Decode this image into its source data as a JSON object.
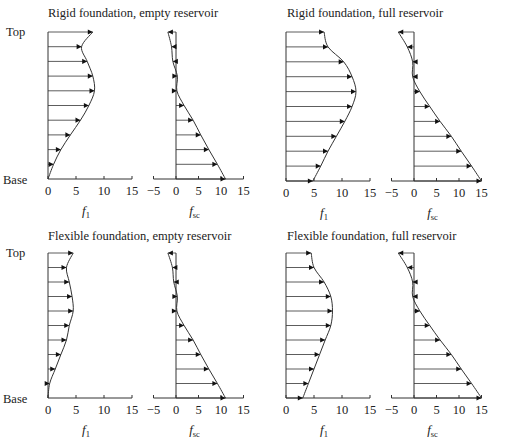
{
  "figure": {
    "labels": {
      "top": "Top",
      "base": "Base"
    }
  },
  "chart_data": [
    {
      "type": "line",
      "title": "Rigid foundation, empty reservoir",
      "subplots": [
        {
          "xlabel": "f1",
          "xlabel_main": "f",
          "xlabel_sub": "1",
          "xticks": [
            0,
            5,
            10,
            15
          ],
          "xlim": [
            0,
            15
          ],
          "heights": [
            "Top",
            "",
            "",
            "",
            "",
            "",
            "",
            "",
            "",
            "",
            "Base"
          ],
          "values": [
            8.0,
            6.0,
            7.0,
            8.0,
            8.3,
            7.3,
            5.8,
            4.0,
            2.3,
            1.0,
            0.0
          ]
        },
        {
          "xlabel": "fsc",
          "xlabel_main": "f",
          "xlabel_sub": "sc",
          "xticks": [
            -5,
            0,
            5,
            10,
            15
          ],
          "xlim": [
            -5,
            15
          ],
          "values": [
            -1.8,
            -1.0,
            -0.7,
            0.3,
            0.2,
            1.8,
            3.8,
            5.5,
            7.3,
            9.2,
            11.0
          ]
        }
      ]
    },
    {
      "type": "line",
      "title": "Rigid foundation, full reservoir",
      "subplots": [
        {
          "xlabel": "f1",
          "xlabel_main": "f",
          "xlabel_sub": "1",
          "xticks": [
            0,
            5,
            10,
            15
          ],
          "xlim": [
            0,
            15
          ],
          "values": [
            6.8,
            7.5,
            10.3,
            11.8,
            12.5,
            11.8,
            10.5,
            9.0,
            7.5,
            6.2,
            4.8
          ]
        },
        {
          "xlabel": "fsc",
          "xlabel_main": "f",
          "xlabel_sub": "sc",
          "xticks": [
            -5,
            0,
            5,
            10,
            15
          ],
          "xlim": [
            -5,
            15
          ],
          "values": [
            -3.5,
            -1.5,
            -0.3,
            -0.3,
            1.3,
            3.5,
            5.8,
            8.3,
            10.5,
            12.8,
            15.0
          ]
        }
      ]
    },
    {
      "type": "line",
      "title": "Flexible foundation, empty reservoir",
      "subplots": [
        {
          "xlabel": "f1",
          "xlabel_main": "f",
          "xlabel_sub": "1",
          "xticks": [
            0,
            5,
            10,
            15
          ],
          "xlim": [
            0,
            15
          ],
          "values": [
            4.5,
            3.3,
            3.8,
            4.3,
            4.5,
            3.8,
            3.3,
            2.3,
            1.3,
            0.3,
            0.0
          ]
        },
        {
          "xlabel": "fsc",
          "xlabel_main": "f",
          "xlabel_sub": "sc",
          "xticks": [
            -5,
            0,
            5,
            10,
            15
          ],
          "xlim": [
            -5,
            15
          ],
          "values": [
            -1.8,
            -0.8,
            -0.5,
            0.3,
            0.2,
            1.8,
            3.8,
            5.5,
            7.3,
            9.2,
            11.0
          ]
        }
      ]
    },
    {
      "type": "line",
      "title": "Flexible foundation, full reservoir",
      "subplots": [
        {
          "xlabel": "f1",
          "xlabel_main": "f",
          "xlabel_sub": "1",
          "xticks": [
            0,
            5,
            10,
            15
          ],
          "xlim": [
            0,
            15
          ],
          "values": [
            4.5,
            5.0,
            6.8,
            8.0,
            8.3,
            8.0,
            7.0,
            6.0,
            5.0,
            4.0,
            3.0
          ]
        },
        {
          "xlabel": "fsc",
          "xlabel_main": "f",
          "xlabel_sub": "sc",
          "xticks": [
            -5,
            0,
            5,
            10,
            15
          ],
          "xlim": [
            -5,
            15
          ],
          "values": [
            -3.5,
            -1.5,
            -0.3,
            -0.3,
            1.3,
            3.5,
            5.8,
            8.3,
            10.5,
            12.8,
            15.0
          ]
        }
      ]
    }
  ],
  "layout": {
    "panels": [
      {
        "titleX": 48,
        "titleY": 17,
        "topY": 32,
        "baseY": 179,
        "f1X0": 48,
        "fscX0": 176,
        "showSideLabels": true
      },
      {
        "titleX": 287,
        "titleY": 17,
        "topY": 32,
        "baseY": 181,
        "f1X0": 286,
        "fscX0": 414,
        "showSideLabels": false
      },
      {
        "titleX": 48,
        "titleY": 240,
        "topY": 253,
        "baseY": 398,
        "f1X0": 48,
        "fscX0": 176,
        "showSideLabels": true
      },
      {
        "titleX": 287,
        "titleY": 240,
        "topY": 253,
        "baseY": 398,
        "f1X0": 286,
        "fscX0": 414,
        "showSideLabels": false
      }
    ],
    "pxPerUnitF1": 5.6,
    "pxPerUnitFsc": 4.5
  }
}
